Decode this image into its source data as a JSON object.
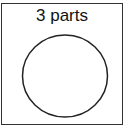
{
  "diagram": {
    "label": "3 parts",
    "shape": "circle",
    "colors": {
      "stroke": "#222222",
      "frame": "#333333",
      "background": "#ffffff"
    }
  }
}
